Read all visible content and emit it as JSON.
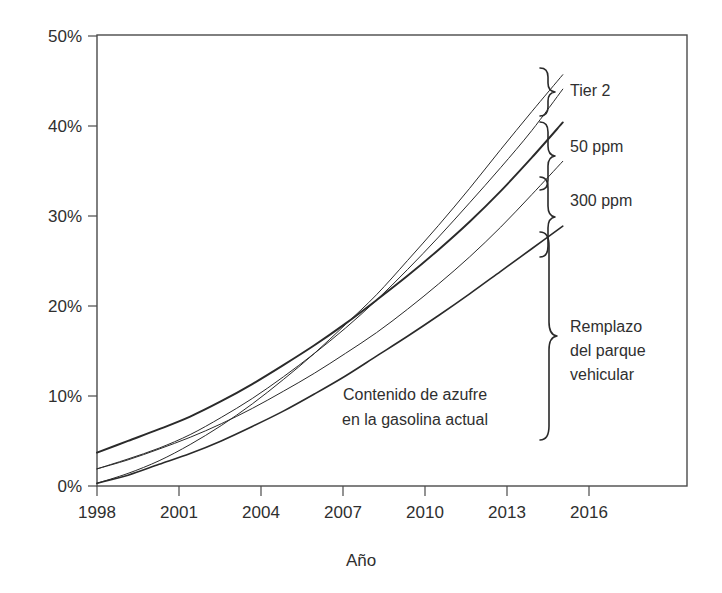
{
  "chart_data": {
    "type": "line",
    "title": "",
    "xlabel": "Año",
    "ylabel": "",
    "xlim": [
      1998,
      2017
    ],
    "ylim": [
      0,
      50
    ],
    "grid": false,
    "legend_position": "right-braces",
    "x_tick_labels": [
      "1998",
      "2001",
      "2004",
      "2007",
      "2010",
      "2013",
      "2016"
    ],
    "x_ticks": [
      1998,
      2001,
      2004,
      2007,
      2010,
      2013,
      2016
    ],
    "y_tick_labels": [
      "0%",
      "10%",
      "20%",
      "30%",
      "40%",
      "50%"
    ],
    "y_ticks": [
      0,
      10,
      20,
      30,
      40,
      50
    ],
    "x": [
      1998,
      1999,
      2000,
      2001,
      2002,
      2003,
      2004,
      2005,
      2006,
      2007,
      2008,
      2009,
      2010,
      2011,
      2012,
      2013
    ],
    "series": [
      {
        "name": "Tier 2 (superior)",
        "stroke_width": 1.0,
        "values": [
          0.3,
          1.4,
          2.8,
          4.6,
          6.7,
          9.1,
          11.8,
          14.7,
          17.9,
          21.2,
          25.0,
          28.9,
          33.0,
          37.3,
          41.5,
          45.6
        ]
      },
      {
        "name": "Tier 2 (inferior)",
        "stroke_width": 1.0,
        "values": [
          1.9,
          3.0,
          4.2,
          5.7,
          7.6,
          9.7,
          12.1,
          14.7,
          17.5,
          20.6,
          24.0,
          27.6,
          31.4,
          35.3,
          39.4,
          44.0
        ]
      },
      {
        "name": "50 ppm",
        "stroke_width": 1.9,
        "values": [
          3.7,
          5.0,
          6.3,
          7.7,
          9.4,
          11.3,
          13.4,
          15.6,
          18.0,
          20.6,
          23.3,
          26.2,
          29.3,
          32.7,
          36.4,
          40.3
        ]
      },
      {
        "name": "300 ppm",
        "stroke_width": 1.0,
        "values": [
          1.9,
          2.9,
          4.1,
          5.4,
          6.9,
          8.6,
          10.5,
          12.5,
          14.7,
          17.0,
          19.6,
          22.4,
          25.4,
          28.7,
          32.3,
          36.0
        ]
      },
      {
        "name": "Contenido de azufre en la gasolina actual",
        "stroke_width": 1.6,
        "values": [
          0.3,
          1.2,
          2.4,
          3.6,
          5.0,
          6.6,
          8.3,
          10.2,
          12.2,
          14.4,
          16.6,
          18.9,
          21.3,
          23.8,
          26.3,
          28.8
        ]
      }
    ],
    "annotations": [
      {
        "key": "tier2",
        "label": "Tier 2",
        "brace_top_pct": 46.4,
        "brace_bottom_pct": 42.5
      },
      {
        "key": "ppm50",
        "label": "50 ppm",
        "brace_top_pct": 41.4,
        "brace_bottom_pct": 35.9
      },
      {
        "key": "ppm300",
        "label": "300 ppm",
        "brace_top_pct": 35.4,
        "brace_bottom_pct": 28.8
      },
      {
        "key": "remplazo",
        "label_lines": [
          "Remplazo",
          "del parque",
          "vehicular"
        ],
        "brace_top_pct": 28.3,
        "brace_bottom_pct": 0.2
      },
      {
        "key": "gasolina",
        "label_lines": [
          "Contenido de azufre",
          "en la gasolina actual"
        ]
      }
    ]
  },
  "axis": {
    "x_title": "Año",
    "y_ticks": [
      "0%",
      "10%",
      "20%",
      "30%",
      "40%",
      "50%"
    ],
    "x_ticks": [
      "1998",
      "2001",
      "2004",
      "2007",
      "2010",
      "2013",
      "2016"
    ]
  },
  "labels": {
    "tier2": "Tier 2",
    "ppm50": "50 ppm",
    "ppm300": "300 ppm",
    "remplazo_l1": "Remplazo",
    "remplazo_l2": "del parque",
    "remplazo_l3": "vehicular",
    "gasolina_l1": "Contenido de azufre",
    "gasolina_l2": "en la gasolina actual"
  },
  "colors": {
    "line": "#2a2a2a",
    "frame": "#4a4a4a",
    "text": "#2f2f2f",
    "background": "#ffffff"
  }
}
